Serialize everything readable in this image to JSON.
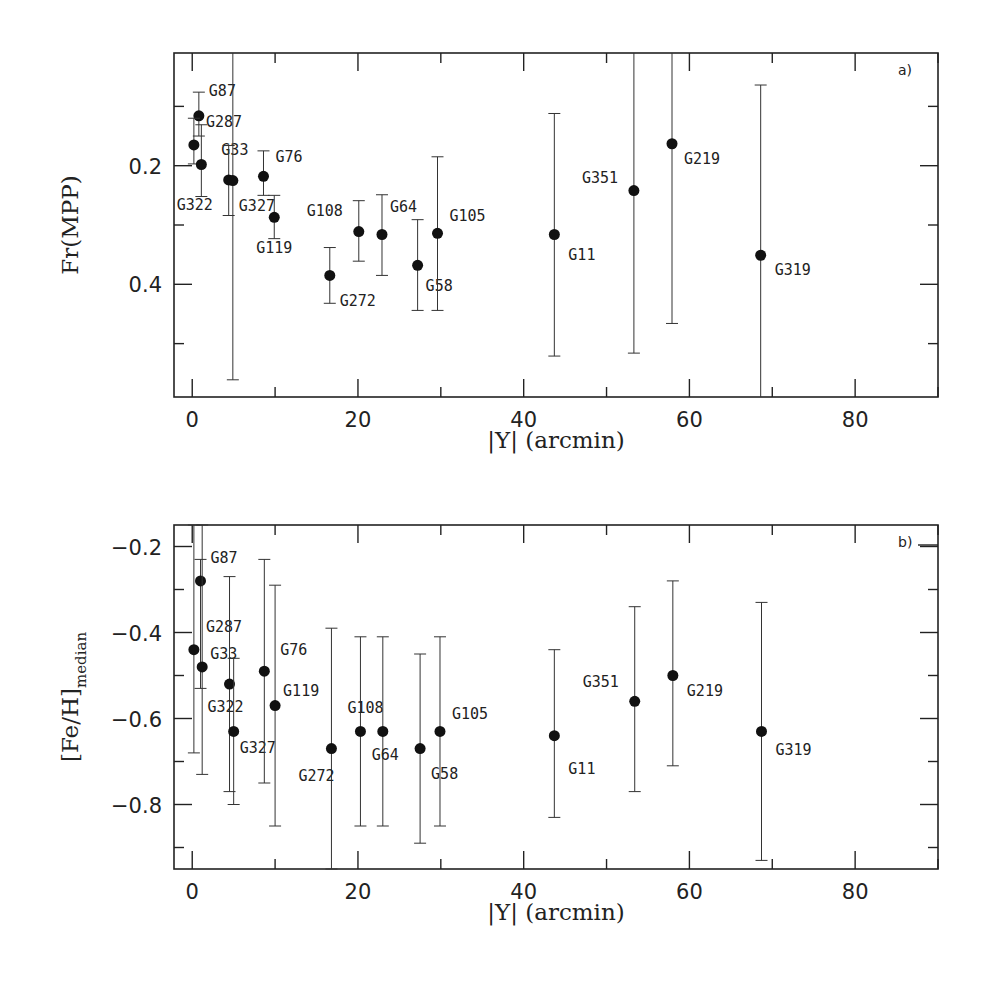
{
  "chart_data": [
    {
      "type": "scatter",
      "panel_label": "a)",
      "title": "",
      "xlabel": "|Y| (arcmin)",
      "ylabel": "Fr(MPP)",
      "xlim": [
        -2.2,
        90
      ],
      "ylim": [
        0.59,
        0.01
      ],
      "y_inverted": true,
      "grid": false,
      "x_ticks": [
        0,
        20,
        40,
        60,
        80
      ],
      "y_ticks": [
        0.2,
        0.4
      ],
      "y_minor_ticks": [
        0.1,
        0.3,
        0.5
      ],
      "points": [
        {
          "name": "G87",
          "x": 0.8,
          "y": 0.116,
          "err_low": 0.076,
          "err_high": 0.15,
          "lx": 10,
          "ly": -20
        },
        {
          "name": "G287",
          "x": 0.2,
          "y": 0.165,
          "err_low": 0.12,
          "err_high": 0.197,
          "lx": 12,
          "ly": -18
        },
        {
          "name": "G33",
          "x": 1.1,
          "y": 0.198,
          "err_low": 0.131,
          "err_high": 0.252,
          "lx": 20,
          "ly": -10
        },
        {
          "name": "G322",
          "x": 4.4,
          "y": 0.224,
          "err_low": 0.166,
          "err_high": 0.284,
          "lx": -52,
          "ly": 30
        },
        {
          "name": "G327",
          "x": 4.9,
          "y": 0.225,
          "err_low": 0.0,
          "err_high": 0.561,
          "lx": 6,
          "ly": 30
        },
        {
          "name": "G76",
          "x": 8.6,
          "y": 0.218,
          "err_low": 0.175,
          "err_high": 0.25,
          "lx": 12,
          "ly": -14
        },
        {
          "name": "G119",
          "x": 9.9,
          "y": 0.287,
          "err_low": 0.25,
          "err_high": 0.323,
          "lx": -18,
          "ly": 36
        },
        {
          "name": "G272",
          "x": 16.6,
          "y": 0.385,
          "err_low": 0.338,
          "err_high": 0.432,
          "lx": 10,
          "ly": 31
        },
        {
          "name": "G108",
          "x": 20.1,
          "y": 0.311,
          "err_low": 0.259,
          "err_high": 0.361,
          "lx": -52,
          "ly": -16
        },
        {
          "name": "G64",
          "x": 22.9,
          "y": 0.316,
          "err_low": 0.249,
          "err_high": 0.385,
          "lx": 8,
          "ly": -22
        },
        {
          "name": "G58",
          "x": 27.2,
          "y": 0.368,
          "err_low": 0.291,
          "err_high": 0.444,
          "lx": 8,
          "ly": 26
        },
        {
          "name": "G105",
          "x": 29.6,
          "y": 0.314,
          "err_low": 0.185,
          "err_high": 0.444,
          "lx": 12,
          "ly": -12
        },
        {
          "name": "G11",
          "x": 43.7,
          "y": 0.316,
          "err_low": 0.112,
          "err_high": 0.521,
          "lx": 14,
          "ly": 26
        },
        {
          "name": "G351",
          "x": 53.3,
          "y": 0.242,
          "err_low": 0.0,
          "err_high": 0.516,
          "lx": -52,
          "ly": -8
        },
        {
          "name": "G219",
          "x": 57.9,
          "y": 0.163,
          "err_low": 0.0,
          "err_high": 0.466,
          "lx": 12,
          "ly": 20
        },
        {
          "name": "G319",
          "x": 68.6,
          "y": 0.351,
          "err_low": 0.064,
          "err_high": 0.6,
          "lx": 14,
          "ly": 20
        }
      ]
    },
    {
      "type": "scatter",
      "panel_label": "b)",
      "title": "",
      "xlabel": "|Y| (arcmin)",
      "ylabel": "[Fe/H]",
      "ylabel_subscript": "median",
      "xlim": [
        -2.2,
        90
      ],
      "ylim": [
        -0.95,
        -0.15
      ],
      "y_inverted": false,
      "grid": false,
      "x_ticks": [
        0,
        20,
        40,
        60,
        80
      ],
      "y_ticks": [
        -0.2,
        -0.4,
        -0.6,
        -0.8
      ],
      "y_tick_labels": [
        "−0.2",
        "−0.4",
        "−0.6",
        "−0.8"
      ],
      "y_minor_ticks": [
        -0.3,
        -0.5,
        -0.7,
        -0.9
      ],
      "points": [
        {
          "name": "G87",
          "x": 1.0,
          "y": -0.28,
          "err_low": -0.53,
          "err_high": -0.23,
          "lx": 10,
          "ly": -18
        },
        {
          "name": "G287",
          "x": 0.2,
          "y": -0.44,
          "err_low": -0.68,
          "err_high": -0.15,
          "lx": 12,
          "ly": -18
        },
        {
          "name": "G33",
          "x": 1.2,
          "y": -0.48,
          "err_low": -0.73,
          "err_high": -0.15,
          "lx": 8,
          "ly": -8
        },
        {
          "name": "G322",
          "x": 4.5,
          "y": -0.52,
          "err_low": -0.77,
          "err_high": -0.27,
          "lx": -22,
          "ly": 28
        },
        {
          "name": "G327",
          "x": 5.0,
          "y": -0.63,
          "err_low": -0.8,
          "err_high": -0.46,
          "lx": 6,
          "ly": 22
        },
        {
          "name": "G76",
          "x": 8.7,
          "y": -0.49,
          "err_low": -0.75,
          "err_high": -0.23,
          "lx": 16,
          "ly": -16
        },
        {
          "name": "G119",
          "x": 10.0,
          "y": -0.57,
          "err_low": -0.85,
          "err_high": -0.29,
          "lx": 8,
          "ly": -10
        },
        {
          "name": "G272",
          "x": 16.8,
          "y": -0.67,
          "err_low": -0.95,
          "err_high": -0.39,
          "lx": -33,
          "ly": 32
        },
        {
          "name": "G108",
          "x": 20.3,
          "y": -0.63,
          "err_low": -0.85,
          "err_high": -0.41,
          "lx": -13,
          "ly": -18
        },
        {
          "name": "G64",
          "x": 23.0,
          "y": -0.63,
          "err_low": -0.85,
          "err_high": -0.41,
          "lx": -11,
          "ly": 29
        },
        {
          "name": "G58",
          "x": 27.5,
          "y": -0.67,
          "err_low": -0.89,
          "err_high": -0.45,
          "lx": 11,
          "ly": 30
        },
        {
          "name": "G105",
          "x": 29.9,
          "y": -0.63,
          "err_low": -0.85,
          "err_high": -0.41,
          "lx": 12,
          "ly": -12
        },
        {
          "name": "G11",
          "x": 43.7,
          "y": -0.64,
          "err_low": -0.83,
          "err_high": -0.44,
          "lx": 14,
          "ly": 38
        },
        {
          "name": "G351",
          "x": 53.4,
          "y": -0.56,
          "err_low": -0.77,
          "err_high": -0.34,
          "lx": -52,
          "ly": -14
        },
        {
          "name": "G219",
          "x": 58.0,
          "y": -0.5,
          "err_low": -0.71,
          "err_high": -0.28,
          "lx": 14,
          "ly": 20
        },
        {
          "name": "G319",
          "x": 68.7,
          "y": -0.63,
          "err_low": -0.93,
          "err_high": -0.33,
          "lx": 14,
          "ly": 24
        }
      ]
    }
  ]
}
